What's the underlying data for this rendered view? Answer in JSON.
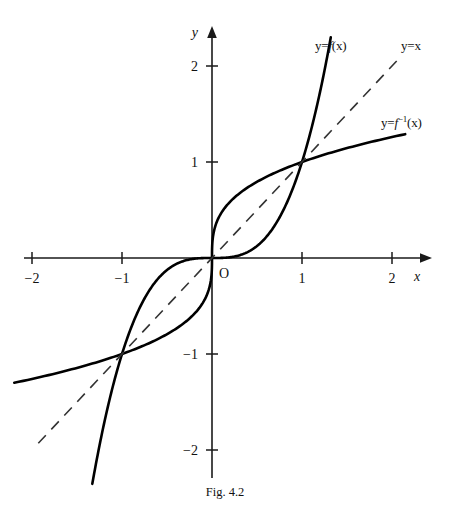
{
  "caption": "Fig. 4.2",
  "axes": {
    "x_axis_name": "x",
    "y_axis_name": "y",
    "origin_label": "O",
    "x_ticks": [
      {
        "value": -2,
        "label": "−2"
      },
      {
        "value": -1,
        "label": "−1"
      },
      {
        "value": 1,
        "label": "1"
      },
      {
        "value": 2,
        "label": "2"
      }
    ],
    "y_ticks": [
      {
        "value": -2,
        "label": "−2"
      },
      {
        "value": -1,
        "label": "−1"
      },
      {
        "value": 1,
        "label": "1"
      },
      {
        "value": 2,
        "label": "2"
      }
    ]
  },
  "labels": {
    "function_label_prefix": "y=",
    "function_label_name": "f",
    "function_label_arg": "(x)",
    "identity_label": "y=x",
    "inverse_label_prefix": "y=",
    "inverse_label_name": "f",
    "inverse_label_exponent": "−1",
    "inverse_label_arg": "(x)"
  },
  "colors": {
    "curve": "#000000",
    "axis": "#1a1a1a",
    "identity": "#333333",
    "background": "#ffffff"
  },
  "chart_data": {
    "type": "line",
    "title": "Fig. 4.2",
    "xlabel": "x",
    "ylabel": "y",
    "xlim": [
      -2.25,
      2.3
    ],
    "ylim": [
      -2.4,
      2.45
    ],
    "xticks": [
      -2,
      -1,
      1,
      2
    ],
    "yticks": [
      -2,
      -1,
      1,
      2
    ],
    "grid": false,
    "legend": "inline-annotations",
    "annotations": [
      {
        "text": "y=f(x)",
        "x": 1.37,
        "y": 2.22
      },
      {
        "text": "y=x",
        "x": 2.12,
        "y": 2.22
      },
      {
        "text": "y=f^-1(x)",
        "x": 1.87,
        "y": 1.42
      },
      {
        "text": "O",
        "x": 0.08,
        "y": -0.12
      }
    ],
    "intersections": [
      {
        "x": -1,
        "y": -1
      },
      {
        "x": 0,
        "y": 0
      },
      {
        "x": 1,
        "y": 1
      }
    ],
    "series": [
      {
        "name": "y=f(x)",
        "formula": "y = x^3",
        "style": "solid",
        "x": [
          -1.33,
          -1.2,
          -1.1,
          -1.0,
          -0.9,
          -0.8,
          -0.7,
          -0.6,
          -0.5,
          -0.4,
          -0.3,
          -0.2,
          -0.1,
          0,
          0.1,
          0.2,
          0.3,
          0.4,
          0.5,
          0.6,
          0.7,
          0.8,
          0.9,
          1.0,
          1.1,
          1.2,
          1.32
        ],
        "values": [
          -2.35,
          -1.73,
          -1.33,
          -1.0,
          -0.73,
          -0.51,
          -0.34,
          -0.22,
          -0.13,
          -0.06,
          -0.03,
          -0.01,
          0.0,
          0,
          0.0,
          0.01,
          0.03,
          0.06,
          0.13,
          0.22,
          0.34,
          0.51,
          0.73,
          1.0,
          1.33,
          1.73,
          2.3
        ]
      },
      {
        "name": "y=f^-1(x)",
        "formula": "y = x^(1/3)",
        "style": "solid",
        "x": [
          -2.15,
          -1.73,
          -1.33,
          -1.0,
          -0.73,
          -0.51,
          -0.34,
          -0.22,
          -0.13,
          -0.06,
          -0.03,
          -0.01,
          0,
          0.01,
          0.03,
          0.06,
          0.13,
          0.22,
          0.34,
          0.51,
          0.73,
          1.0,
          1.33,
          1.73,
          2.15
        ],
        "values": [
          -1.29,
          -1.2,
          -1.1,
          -1.0,
          -0.9,
          -0.8,
          -0.7,
          -0.6,
          -0.5,
          -0.4,
          -0.3,
          -0.2,
          0,
          0.2,
          0.3,
          0.4,
          0.5,
          0.6,
          0.7,
          0.8,
          0.9,
          1.0,
          1.1,
          1.2,
          1.29
        ]
      },
      {
        "name": "y=x",
        "formula": "y = x",
        "style": "dashed",
        "x": [
          -1.93,
          2.09
        ],
        "values": [
          -1.93,
          2.09
        ]
      }
    ]
  }
}
